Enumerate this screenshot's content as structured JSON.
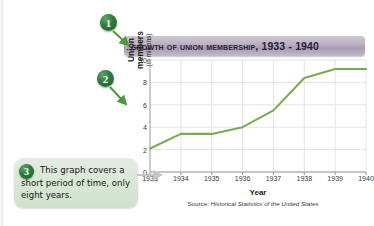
{
  "figure": {
    "title": "Growth of Union Membership, 1933 - 1940"
  },
  "badges": [
    {
      "id": "1",
      "label": "1",
      "target": "title"
    },
    {
      "id": "2",
      "label": "2",
      "target": "y-axis-label"
    },
    {
      "id": "3",
      "label": "3",
      "target": "x-axis"
    }
  ],
  "callout": {
    "number": "3",
    "text": "This graph covers a short period of time, only eight years."
  },
  "source": {
    "lead": "Source: ",
    "citation": "Historical Statistics of the United States"
  },
  "colors": {
    "line": "#7aac4e",
    "badge_green": "#2e7d3c",
    "title_band": "#a99cb3",
    "callout_bg": "#d7e7d5",
    "grid": "#e4e4e4",
    "axis": "#9a9a9a",
    "arrow_green": "#4e9a3f",
    "arrow_gray": "#b9bdb9"
  },
  "chart_data": {
    "type": "line",
    "title": "Growth of Union Membership, 1933 - 1940",
    "xlabel": "Year",
    "ylabel": "Union members (in millions)",
    "ylabel_main": "Union members",
    "ylabel_sub": "(in millions)",
    "categories": [
      "1933",
      "1934",
      "1935",
      "1936",
      "1937",
      "1938",
      "1939",
      "1940"
    ],
    "values": [
      2.1,
      3.4,
      3.4,
      4.0,
      5.5,
      8.4,
      9.2,
      9.2
    ],
    "yticks": [
      0,
      2,
      4,
      6,
      8,
      10
    ],
    "ylim": [
      0,
      10
    ],
    "grid": true,
    "legend": false,
    "series_color": "#7aac4e"
  }
}
